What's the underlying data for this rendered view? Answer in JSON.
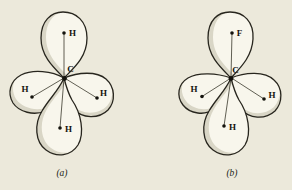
{
  "figure": {
    "colors": {
      "background": "#ece9db",
      "lobe": "#f8f6ec",
      "shade": "#d9d6c6",
      "line": "#28261e",
      "ink": "#14130d"
    },
    "panels": [
      {
        "caption": "(a)",
        "central_atom": "C",
        "top_label": "H",
        "left_label": "H",
        "right_label": "H",
        "bottom_label": "H"
      },
      {
        "caption": "(b)",
        "central_atom": "C",
        "top_label": "F",
        "left_label": "H",
        "right_label": "H",
        "bottom_label": "H"
      }
    ]
  }
}
